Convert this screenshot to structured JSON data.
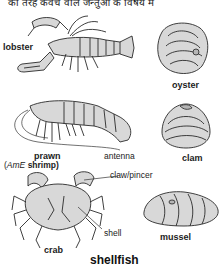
{
  "header": {
    "partial_text": "की तरह कवच वाले जन्तुओं के विषय में"
  },
  "title": "shellfish",
  "items": [
    {
      "label": "lobster"
    },
    {
      "label": "oyster"
    },
    {
      "label": "prawn",
      "alt_prefix": "(",
      "alt_region": "AmE",
      "alt_word": " shrimp)"
    },
    {
      "label": "clam"
    },
    {
      "label": "crab"
    },
    {
      "label": "mussel"
    }
  ],
  "annotations": {
    "antenna": "antenna",
    "claw": "claw/pincer",
    "shell": "shell"
  }
}
